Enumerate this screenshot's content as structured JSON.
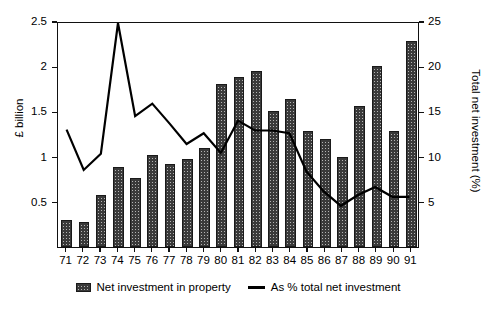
{
  "chart_data": {
    "type": "bar",
    "title": "",
    "subtitle": "",
    "categories": [
      "71",
      "72",
      "73",
      "74",
      "75",
      "76",
      "77",
      "78",
      "79",
      "80",
      "81",
      "82",
      "83",
      "84",
      "85",
      "86",
      "87",
      "88",
      "89",
      "90",
      "91"
    ],
    "series": [
      {
        "name": "Net investment in property",
        "type": "bar",
        "axis": "left",
        "unit": "£ billion",
        "values": [
          0.3,
          0.28,
          0.58,
          0.88,
          0.76,
          1.02,
          0.92,
          0.97,
          1.1,
          1.8,
          1.88,
          1.95,
          1.5,
          1.64,
          1.28,
          1.19,
          1.0,
          1.56,
          2.0,
          1.28,
          2.28
        ]
      },
      {
        "name": "As % total net investment",
        "type": "line",
        "axis": "right",
        "unit": "%",
        "values": [
          13.1,
          8.6,
          10.4,
          25.0,
          14.6,
          16.0,
          13.8,
          11.5,
          12.7,
          10.5,
          14.1,
          13.0,
          13.0,
          12.7,
          8.4,
          6.2,
          4.6,
          5.8,
          6.7,
          5.6,
          5.6
        ]
      }
    ],
    "xlabel": "",
    "ylabel": "£ billion",
    "y2label": "Total net investment (%)",
    "ylim": [
      0,
      2.5
    ],
    "y2lim": [
      0,
      25
    ],
    "yticks": [
      "0.5",
      "1",
      "1.5",
      "2",
      "2.5"
    ],
    "ytick_values": [
      0.5,
      1,
      1.5,
      2,
      2.5
    ],
    "y2ticks": [
      "5",
      "10",
      "15",
      "20",
      "25"
    ],
    "y2tick_values": [
      5,
      10,
      15,
      20,
      25
    ],
    "grid": false,
    "legend_position": "bottom",
    "colors": {
      "bar_fill": "#b4b4b4",
      "bar_hatch": "#3a3a3a",
      "bar_edge": "#1a1a1a",
      "line": "#000000",
      "axis": "#111111",
      "background": "#ffffff"
    }
  },
  "legend": {
    "items": [
      {
        "label": "Net investment in property",
        "marker": "hatched-bar-swatch"
      },
      {
        "label": "As % total net investment",
        "marker": "solid-line-swatch"
      }
    ]
  },
  "axes": {
    "left_title": "£ billion",
    "right_title": "Total net investment (%)"
  }
}
